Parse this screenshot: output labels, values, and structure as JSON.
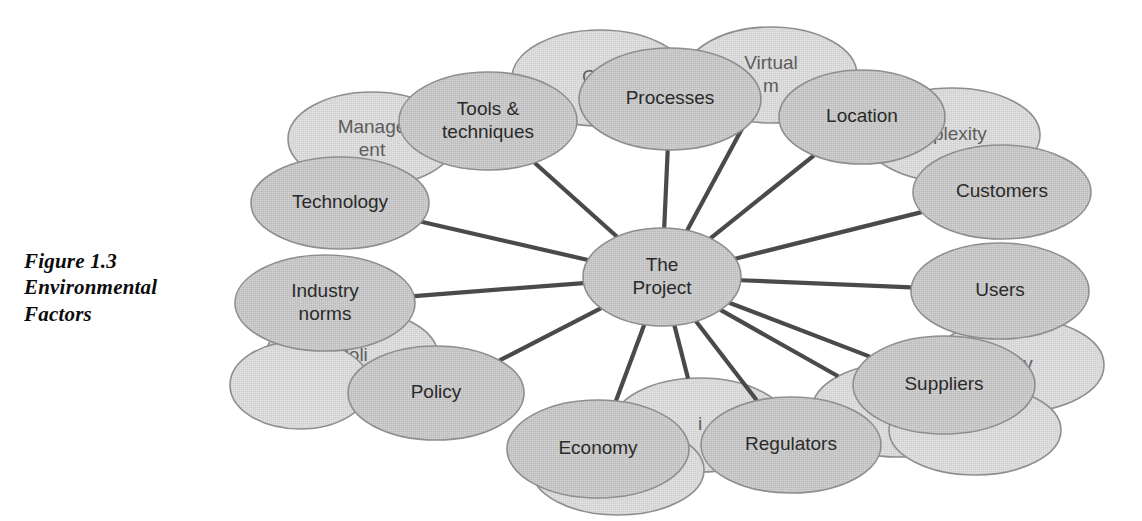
{
  "figure": {
    "caption_lines": [
      "Figure 1.3",
      "Environmental",
      "Factors"
    ],
    "caption_text": "Figure 1.3 Environmental Factors"
  },
  "colors": {
    "page_background": "#ffffff",
    "node_fill_front": "#c6c6c6",
    "node_fill_back": "#d9d9d9",
    "node_stroke": "#8e8e8e",
    "spoke_line": "#4a4a4a",
    "label_text": "#2a2a2a",
    "label_text_obscured": "#5d5d5d",
    "caption_text": "#0c0c0c"
  },
  "diagram": {
    "type": "hub-and-spoke",
    "hub": {
      "id": "the-project",
      "label_lines": [
        "The",
        "Project"
      ],
      "label": "The Project",
      "cx": 662,
      "cy": 277,
      "rx": 79,
      "ry": 49
    },
    "background_nodes": [
      {
        "id": "geography",
        "label": "Geo",
        "cx": 600,
        "cy": 78,
        "rx": 88,
        "ry": 48,
        "clip": "right"
      },
      {
        "id": "virtual-team",
        "label": "Virtual\nm",
        "label_lines": [
          "Virtual",
          "m"
        ],
        "cx": 771,
        "cy": 75,
        "rx": 86,
        "ry": 48
      },
      {
        "id": "complexity",
        "label": "mplexity",
        "cx": 952,
        "cy": 135,
        "rx": 88,
        "ry": 47
      },
      {
        "id": "management",
        "label": "Manage\nent",
        "label_lines": [
          "Manage",
          "ent"
        ],
        "cx": 372,
        "cy": 139,
        "rx": 84,
        "ry": 47
      },
      {
        "id": "politics",
        "label": "Poli",
        "cx": 352,
        "cy": 356,
        "rx": 86,
        "ry": 47
      },
      {
        "id": "loyalty",
        "label": "alty",
        "cx": 1018,
        "cy": 365,
        "rx": 86,
        "ry": 47
      },
      {
        "id": "knowledge",
        "label": "Kn",
        "cx": 898,
        "cy": 410,
        "rx": 86,
        "ry": 47
      },
      {
        "id": "unnamed-bottom",
        "label": "i",
        "cx": 700,
        "cy": 425,
        "rx": 88,
        "ry": 47
      },
      {
        "id": "unnamed-right-lower",
        "label": "",
        "cx": 975,
        "cy": 430,
        "rx": 86,
        "ry": 45
      },
      {
        "id": "unnamed-bottom-left",
        "label": "",
        "cx": 618,
        "cy": 470,
        "rx": 86,
        "ry": 45
      },
      {
        "id": "unnamed-left-lower",
        "label": "",
        "cx": 300,
        "cy": 385,
        "rx": 70,
        "ry": 44
      }
    ],
    "foreground_nodes": [
      {
        "id": "tools-techniques",
        "label": "Tools & techniques",
        "label_lines": [
          "Tools &",
          "techniques"
        ],
        "cx": 488,
        "cy": 121,
        "rx": 89,
        "ry": 49
      },
      {
        "id": "processes",
        "label": "Processes",
        "label_lines": [
          "Processes"
        ],
        "cx": 670,
        "cy": 99,
        "rx": 91,
        "ry": 51
      },
      {
        "id": "location",
        "label": "Location",
        "label_lines": [
          "Location"
        ],
        "cx": 862,
        "cy": 117,
        "rx": 83,
        "ry": 47
      },
      {
        "id": "customers",
        "label": "Customers",
        "label_lines": [
          "Customers"
        ],
        "cx": 1002,
        "cy": 192,
        "rx": 89,
        "ry": 47
      },
      {
        "id": "users",
        "label": "Users",
        "label_lines": [
          "Users"
        ],
        "cx": 1000,
        "cy": 291,
        "rx": 89,
        "ry": 48
      },
      {
        "id": "suppliers",
        "label": "Suppliers",
        "label_lines": [
          "Suppliers"
        ],
        "cx": 944,
        "cy": 385,
        "rx": 91,
        "ry": 49
      },
      {
        "id": "regulators",
        "label": "Regulators",
        "label_lines": [
          "Regulators"
        ],
        "cx": 791,
        "cy": 445,
        "rx": 90,
        "ry": 48
      },
      {
        "id": "economy",
        "label": "Economy",
        "label_lines": [
          "Economy"
        ],
        "cx": 598,
        "cy": 449,
        "rx": 91,
        "ry": 49
      },
      {
        "id": "policy",
        "label": "Policy",
        "label_lines": [
          "Policy"
        ],
        "cx": 436,
        "cy": 393,
        "rx": 88,
        "ry": 47
      },
      {
        "id": "industry-norms",
        "label": "Industry norms",
        "label_lines": [
          "Industry",
          "norms"
        ],
        "cx": 325,
        "cy": 303,
        "rx": 90,
        "ry": 48
      },
      {
        "id": "technology",
        "label": "Technology",
        "label_lines": [
          "Technology"
        ],
        "cx": 340,
        "cy": 203,
        "rx": 89,
        "ry": 46
      }
    ],
    "spokes": [
      {
        "from": "the-project",
        "to": "tools-techniques"
      },
      {
        "from": "the-project",
        "to": "processes"
      },
      {
        "from": "the-project",
        "to": "location"
      },
      {
        "from": "the-project",
        "to": "customers"
      },
      {
        "from": "the-project",
        "to": "users"
      },
      {
        "from": "the-project",
        "to": "suppliers"
      },
      {
        "from": "the-project",
        "to": "regulators"
      },
      {
        "from": "the-project",
        "to": "economy"
      },
      {
        "from": "the-project",
        "to": "policy"
      },
      {
        "from": "the-project",
        "to": "industry-norms"
      },
      {
        "from": "the-project",
        "to": "technology"
      },
      {
        "from": "the-project",
        "to": "virtual-team"
      },
      {
        "from": "the-project",
        "to": "knowledge"
      },
      {
        "from": "the-project",
        "to": "unnamed-bottom"
      }
    ]
  }
}
